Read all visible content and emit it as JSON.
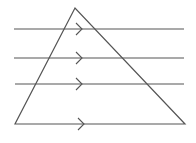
{
  "diagram": {
    "type": "geometry",
    "colors": {
      "stroke": "#555555",
      "background": "#ffffff"
    },
    "triangle": {
      "apex": [
        75,
        8
      ],
      "bottom_left": [
        15,
        124
      ],
      "bottom_right": [
        185,
        124
      ]
    },
    "parallel_lines": [
      {
        "y": 29,
        "x1": 14,
        "x2": 184,
        "arrow_x": 79
      },
      {
        "y": 58,
        "x1": 14,
        "x2": 184,
        "arrow_x": 79
      },
      {
        "y": 84,
        "x1": 15,
        "x2": 184,
        "arrow_x": 79
      }
    ],
    "base": {
      "y": 124,
      "x1": 15,
      "x2": 185,
      "arrow_x": 81
    },
    "parallel_mark": "single-arrow"
  }
}
